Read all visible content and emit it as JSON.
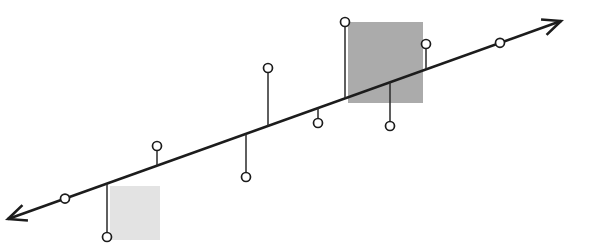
{
  "figure": {
    "title": "",
    "background_color": "#ffffff",
    "width": 590,
    "height": 252
  },
  "chart_data": {
    "type": "scatter",
    "title": "",
    "subtitle": "",
    "xlabel": "",
    "ylabel": "",
    "grid": false,
    "legend": null,
    "axis_line": {
      "name": "trend-axis",
      "color": "#1c1c1c",
      "stroke_width": 2.6,
      "start": {
        "x": 8,
        "y": 219
      },
      "end": {
        "x": 561,
        "y": 21
      },
      "arrow_start": true,
      "arrow_end": true,
      "arrow_size": 20
    },
    "baseline_markers": [
      {
        "id": "b1",
        "x": 65,
        "y": 196,
        "label": ""
      },
      {
        "id": "b2",
        "x": 500,
        "y": 45,
        "label": ""
      }
    ],
    "stems": [
      {
        "id": "s1",
        "x": 107,
        "base_y": 200,
        "tip_y": 237,
        "direction": "down",
        "value": -37
      },
      {
        "id": "s2",
        "x": 157,
        "base_y": 182,
        "tip_y": 146,
        "direction": "up",
        "value": 36
      },
      {
        "id": "s3",
        "x": 246,
        "base_y": 150,
        "tip_y": 177,
        "direction": "down",
        "value": -27
      },
      {
        "id": "s4",
        "x": 268,
        "base_y": 142,
        "tip_y": 68,
        "direction": "up",
        "value": 74
      },
      {
        "id": "s5",
        "x": 318,
        "base_y": 124,
        "tip_y": 123,
        "direction": "down",
        "value": -1
      },
      {
        "id": "s6",
        "x": 345,
        "base_y": 104,
        "tip_y": 22,
        "direction": "up",
        "value": 82
      },
      {
        "id": "s7",
        "x": 390,
        "base_y": 88,
        "tip_y": 126,
        "direction": "down",
        "value": -38
      },
      {
        "id": "s8",
        "x": 426,
        "base_y": 75,
        "tip_y": 44,
        "direction": "up",
        "value": 31
      }
    ],
    "stem_markers_note": "every stem terminates in a small open white circle of radius 4.5 px",
    "marker_style": {
      "radius": 4.5,
      "fill": "#ffffff",
      "stroke": "#1c1c1c",
      "stroke_width": 1.7
    },
    "regions": [
      {
        "id": "region-light",
        "name": "light-highlight-region",
        "x": 110,
        "y": 186,
        "width": 50,
        "height": 54,
        "color": "#e3e3e3",
        "shade": "light"
      },
      {
        "id": "region-dark",
        "name": "dark-highlight-region",
        "x": 348,
        "y": 22,
        "width": 75,
        "height": 81,
        "color": "#ababab",
        "shade": "dark"
      }
    ],
    "colors": {
      "line": "#1c1c1c",
      "stem": "#2a2a2a",
      "marker_fill": "#ffffff",
      "region_light": "#e3e3e3",
      "region_dark": "#ababab",
      "background": "#ffffff"
    }
  }
}
